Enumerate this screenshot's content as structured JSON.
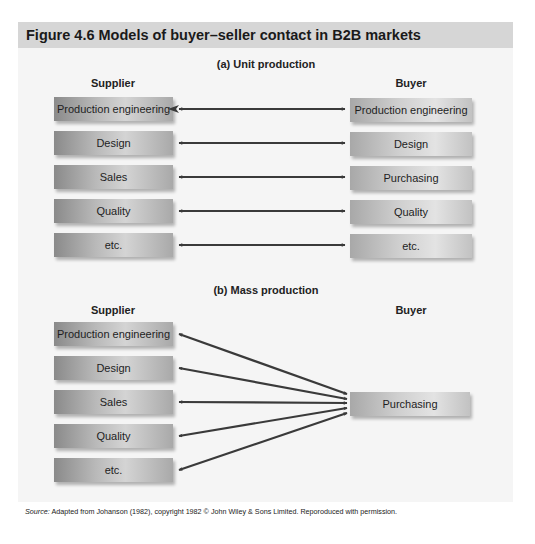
{
  "figure": {
    "title": "Figure 4.6  Models of buyer–seller contact in B2B markets",
    "colors": {
      "header_band": "#d6d6d6",
      "panel_background": "#f5f5f5",
      "arrow": "#3a3a3a"
    }
  },
  "unit_production": {
    "title": "(a) Unit production",
    "supplier_label": "Supplier",
    "buyer_label": "Buyer",
    "supplier_boxes": [
      "Production engineering",
      "Design",
      "Sales",
      "Quality",
      "etc."
    ],
    "buyer_boxes": [
      "Production engineering",
      "Design",
      "Purchasing",
      "Quality",
      "etc."
    ],
    "connections": [
      {
        "from": "Production engineering",
        "to": "Production engineering",
        "type": "bidirectional"
      },
      {
        "from": "Design",
        "to": "Design",
        "type": "bidirectional"
      },
      {
        "from": "Sales",
        "to": "Purchasing",
        "type": "bidirectional"
      },
      {
        "from": "Quality",
        "to": "Quality",
        "type": "bidirectional"
      },
      {
        "from": "etc.",
        "to": "etc.",
        "type": "bidirectional"
      }
    ]
  },
  "mass_production": {
    "title": "(b) Mass production",
    "supplier_label": "Supplier",
    "buyer_label": "Buyer",
    "supplier_boxes": [
      "Production engineering",
      "Design",
      "Sales",
      "Quality",
      "etc."
    ],
    "buyer_boxes": [
      "Purchasing"
    ],
    "connections": [
      {
        "from": "Production engineering",
        "to": "Purchasing",
        "type": "bidirectional"
      },
      {
        "from": "Design",
        "to": "Purchasing",
        "type": "bidirectional"
      },
      {
        "from": "Sales",
        "to": "Purchasing",
        "type": "bidirectional"
      },
      {
        "from": "Quality",
        "to": "Purchasing",
        "type": "bidirectional"
      },
      {
        "from": "etc.",
        "to": "Purchasing",
        "type": "bidirectional"
      }
    ]
  },
  "source": {
    "label": "Source:",
    "text": " Adapted from Johanson (1982), copyright 1982 © John Wiley & Sons Limited. Reporoduced with permission."
  }
}
